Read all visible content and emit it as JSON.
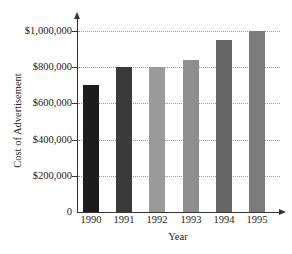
{
  "chart_data": {
    "type": "bar",
    "title": "",
    "xlabel": "Year",
    "ylabel": "Cost of Advertisement",
    "categories": [
      "1990",
      "1991",
      "1992",
      "1993",
      "1994",
      "1995"
    ],
    "values": [
      700000,
      800000,
      800000,
      840000,
      950000,
      1000000
    ],
    "bar_colors": [
      "#1c1c1c",
      "#3a3a3a",
      "#9a9a9a",
      "#8e8e8e",
      "#666666",
      "#7c7c7c"
    ],
    "ylim": [
      0,
      1000000
    ],
    "yticks": [
      0,
      200000,
      400000,
      600000,
      800000,
      1000000
    ],
    "ytick_labels": [
      "0",
      "$200,000",
      "$400,000",
      "$600,000",
      "$800,000",
      "$1,000,000"
    ],
    "grid": true,
    "grid_style": "dotted horizontal",
    "legend": null
  }
}
